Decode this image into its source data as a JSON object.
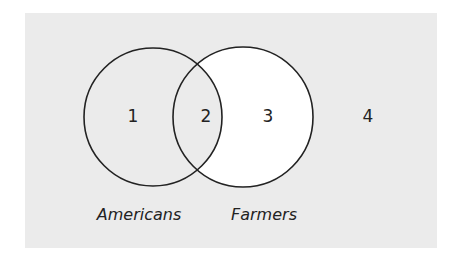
{
  "diagram": {
    "type": "venn",
    "colors": {
      "background": "#ebebeb",
      "highlight_region": "#ffffff",
      "stroke": "#222222"
    },
    "sets": [
      {
        "name": "Americans",
        "label": "Americans"
      },
      {
        "name": "Farmers",
        "label": "Farmers"
      }
    ],
    "regions": [
      {
        "id": "1",
        "label": "1",
        "description": "Americans only",
        "shaded": true
      },
      {
        "id": "2",
        "label": "2",
        "description": "Americans and Farmers",
        "shaded": true
      },
      {
        "id": "3",
        "label": "3",
        "description": "Farmers only",
        "shaded": false
      },
      {
        "id": "4",
        "label": "4",
        "description": "Neither",
        "shaded": true
      }
    ]
  }
}
